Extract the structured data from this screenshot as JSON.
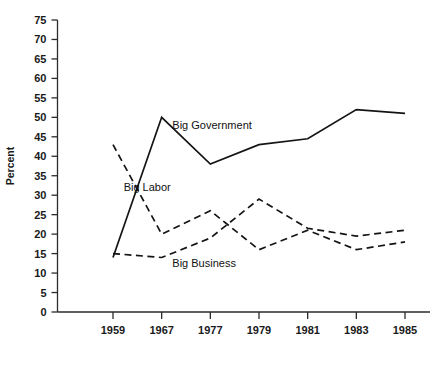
{
  "chart_data": {
    "type": "line",
    "title": "",
    "xlabel": "",
    "ylabel": "Percent",
    "categories": [
      "1959",
      "1967",
      "1977",
      "1979",
      "1981",
      "1983",
      "1985"
    ],
    "ylim": [
      0,
      75
    ],
    "ytick_step": 5,
    "yticks": [
      "0",
      "5",
      "10",
      "15",
      "20",
      "25",
      "30",
      "35",
      "40",
      "45",
      "50",
      "55",
      "60",
      "65",
      "70",
      "75"
    ],
    "grid": false,
    "legend": "inline-annotations",
    "series": [
      {
        "name": "Big Government",
        "style": "solid",
        "color": "#141414",
        "values": [
          14,
          50,
          38,
          43,
          44.5,
          52,
          51
        ],
        "label_x_category_index": 2,
        "label_value": 47
      },
      {
        "name": "Big Labor",
        "style": "dashed",
        "color": "#141414",
        "values": [
          43,
          20,
          26,
          16,
          21,
          16,
          18
        ],
        "label_x_category_index": 1,
        "label_value": 31
      },
      {
        "name": "Big Business",
        "style": "dashed",
        "color": "#141414",
        "values": [
          15,
          14,
          19,
          29,
          21.5,
          19.5,
          21
        ],
        "label_x_category_index": 2,
        "label_value": 11.5
      }
    ]
  },
  "labels": {
    "y_axis_title": "Percent",
    "series_big_government": "Big Government",
    "series_big_labor": "Big Labor",
    "series_big_business": "Big Business"
  },
  "colors": {
    "axis": "#2b2b2b",
    "line": "#141414",
    "text": "#1a1a1a",
    "background": "#ffffff"
  }
}
